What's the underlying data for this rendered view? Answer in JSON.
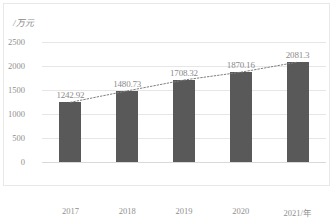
{
  "chart_data": {
    "type": "bar",
    "title": "",
    "subtitle": "",
    "xlabel": "",
    "ylabel": "/万元",
    "categories": [
      "2017",
      "2018",
      "2019",
      "2020",
      "2021/年"
    ],
    "values": [
      1242.92,
      1480.73,
      1708.32,
      1870.16,
      2081.3
    ],
    "data_labels": [
      "1242.92",
      "1480.73",
      "1708.32",
      "1870.16",
      "2081.3"
    ],
    "ylim": [
      0,
      2500
    ],
    "yticks": [
      2500,
      2000,
      1500,
      1000,
      500,
      0
    ],
    "ytick_labels": [
      "2500",
      "2000",
      "1500",
      "1000",
      "500",
      "0"
    ],
    "grid": true,
    "legend": false,
    "legend_position": "none",
    "series": [
      {
        "name": "",
        "kind": "bar",
        "color": "#595959",
        "values": [
          1242.92,
          1480.73,
          1708.32,
          1870.16,
          2081.3
        ]
      },
      {
        "name": "",
        "kind": "trendline",
        "style": "dotted",
        "color": "#7f7f7f",
        "values": [
          1242.92,
          1480.73,
          1708.32,
          1870.16,
          2081.3
        ]
      }
    ],
    "annotations": []
  },
  "style": {
    "bar_color": "#595959",
    "gridline_color": "#e6e6e6",
    "axis_text_color": "#8f8f8f",
    "label_text_color": "#8b8b8b",
    "border_color": "#e8e8e8",
    "background": "#ffffff"
  }
}
